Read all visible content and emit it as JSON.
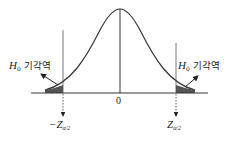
{
  "diagram": {
    "center_label": "0",
    "left_region": {
      "h": "H",
      "h_sub": "0",
      "text": "기각역"
    },
    "right_region": {
      "h": "H",
      "h_sub": "0",
      "text": "기각역"
    },
    "left_critical": {
      "prefix": "−Z",
      "sub": "α/2"
    },
    "right_critical": {
      "prefix": "Z",
      "sub": "α/2"
    },
    "colors": {
      "line": "#333333",
      "shade": "#555555"
    }
  }
}
